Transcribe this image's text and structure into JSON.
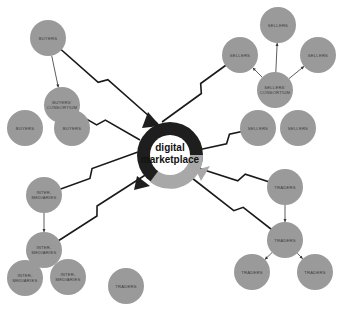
{
  "hub": {
    "label_line1": "digital",
    "label_line2": "marketplace"
  },
  "groups": [
    {
      "name": "buyers",
      "nodes": [
        {
          "id": "b1",
          "label": "BUYERS"
        },
        {
          "id": "b2",
          "label": "BUYERS' CONSORTIUM"
        },
        {
          "id": "b3",
          "label": "BUYERS"
        },
        {
          "id": "b4",
          "label": "BUYERS"
        }
      ]
    },
    {
      "name": "sellers",
      "nodes": [
        {
          "id": "s1",
          "label": "SELLERS"
        },
        {
          "id": "s2",
          "label": "SELLERS"
        },
        {
          "id": "s3",
          "label": "SELLERS"
        },
        {
          "id": "s4",
          "label": "SELLERS' CONSORTIUM"
        },
        {
          "id": "s5",
          "label": "SELLERS"
        },
        {
          "id": "s6",
          "label": "SELLERS"
        }
      ]
    },
    {
      "name": "intermediaries",
      "nodes": [
        {
          "id": "i1",
          "label": "INTER-MEDIARIES"
        },
        {
          "id": "i2",
          "label": "INTER-MEDIARIES"
        },
        {
          "id": "i3",
          "label": "INTER-MEDIARIES"
        },
        {
          "id": "i4",
          "label": "INTER-MEDIARIES"
        }
      ]
    },
    {
      "name": "traders",
      "nodes": [
        {
          "id": "t1",
          "label": "TRADERS"
        },
        {
          "id": "t2",
          "label": "TRADERS"
        },
        {
          "id": "t3",
          "label": "TRADERS"
        },
        {
          "id": "t4",
          "label": "TRADERS"
        },
        {
          "id": "t5",
          "label": "TRADERS"
        }
      ]
    }
  ],
  "colors": {
    "node_fill": "#9a9a9a",
    "hub_dark": "#1e1e1e",
    "hub_light": "#a8a8a8",
    "line": "#1a1a1a"
  }
}
